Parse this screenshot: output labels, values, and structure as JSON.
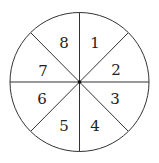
{
  "diagram": {
    "type": "spinner",
    "sections": [
      {
        "label": "1",
        "x": 95,
        "y": 48
      },
      {
        "label": "2",
        "x": 116,
        "y": 75
      },
      {
        "label": "3",
        "x": 115,
        "y": 104
      },
      {
        "label": "4",
        "x": 95,
        "y": 131
      },
      {
        "label": "5",
        "x": 64,
        "y": 131
      },
      {
        "label": "6",
        "x": 42,
        "y": 104
      },
      {
        "label": "7",
        "x": 43,
        "y": 76
      },
      {
        "label": "8",
        "x": 64,
        "y": 48
      }
    ]
  }
}
